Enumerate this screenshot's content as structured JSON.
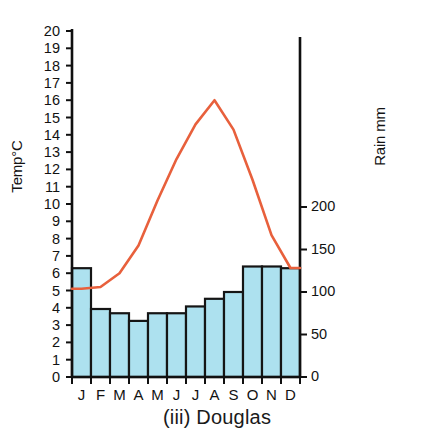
{
  "caption": "(iii) Douglas",
  "axes": {
    "left_title": "Temp°C",
    "right_title": "Rain mm",
    "left_ticks": [
      "0",
      "1",
      "2",
      "3",
      "4",
      "5",
      "6",
      "7",
      "8",
      "9",
      "10",
      "11",
      "12",
      "13",
      "14",
      "15",
      "16",
      "17",
      "18",
      "19",
      "20"
    ],
    "right_ticks": [
      "0",
      "50",
      "100",
      "150",
      "200"
    ]
  },
  "chart_data": {
    "type": "bar",
    "title": "(iii) Douglas",
    "xlabel": "",
    "ylabel": "Temp°C",
    "y2label": "Rain mm",
    "categories": [
      "J",
      "F",
      "M",
      "A",
      "M",
      "J",
      "J",
      "A",
      "S",
      "O",
      "N",
      "D"
    ],
    "month_names": [
      "January",
      "February",
      "March",
      "April",
      "May",
      "June",
      "July",
      "August",
      "September",
      "October",
      "November",
      "December"
    ],
    "grid": false,
    "legend": "none",
    "ylim": [
      0,
      20
    ],
    "ytick_step": 1,
    "y2lim": [
      0,
      235
    ],
    "y2ticks": [
      0,
      50,
      100,
      150,
      200
    ],
    "series": [
      {
        "name": "Rain mm",
        "type": "bar",
        "axis": "right",
        "color": "#ade1ef",
        "edge_color": "#151515",
        "values": [
          128,
          80,
          75,
          66,
          75,
          75,
          83,
          92,
          100,
          130,
          130,
          128
        ]
      },
      {
        "name": "Temp°C",
        "type": "line",
        "axis": "left",
        "color": "#e8603c",
        "values": [
          5.1,
          5.2,
          6.0,
          7.6,
          10.2,
          12.6,
          14.6,
          16.0,
          14.3,
          11.4,
          8.2,
          6.3
        ]
      }
    ]
  }
}
